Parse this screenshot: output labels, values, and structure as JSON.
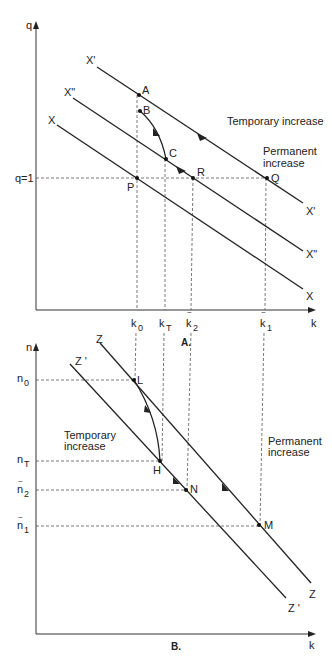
{
  "panel_a": {
    "caption": "A.",
    "y_axis_label": "q",
    "x_axis_label": "k",
    "q_level_label": "q=1",
    "curves": [
      {
        "name": "X'",
        "label_start": "X'",
        "label_end": "X'"
      },
      {
        "name": "X\"",
        "label_start": "X\"",
        "label_end": "X\""
      },
      {
        "name": "X",
        "label_start": "X",
        "label_end": "X"
      }
    ],
    "points": {
      "A": "A",
      "B": "B",
      "C": "C",
      "P": "P",
      "R": "R",
      "Q": "Q"
    },
    "x_ticks": [
      {
        "base": "k",
        "sub": "0",
        "tilde": false
      },
      {
        "base": "k",
        "sub": "T",
        "tilde": false
      },
      {
        "base": "k",
        "sub": "2",
        "tilde": true
      },
      {
        "base": "k",
        "sub": "1",
        "tilde": true
      }
    ],
    "annotations": {
      "temporary": "Temporary increase",
      "permanent_line1": "Permanent",
      "permanent_line2": "increase"
    }
  },
  "panel_b": {
    "caption": "B.",
    "y_axis_label": "n",
    "x_axis_label": "k",
    "curves": [
      {
        "name": "Z",
        "label_start": "Z",
        "label_end": "Z"
      },
      {
        "name": "Z'",
        "label_start": "Z '",
        "label_end": "Z '"
      }
    ],
    "points": {
      "L": "L",
      "H": "H",
      "N": "N",
      "M": "M"
    },
    "y_ticks": [
      {
        "base": "n",
        "sub": "0",
        "tilde": false
      },
      {
        "base": "n",
        "sub": "T",
        "tilde": false
      },
      {
        "base": "n",
        "sub": "2",
        "tilde": true
      },
      {
        "base": "n",
        "sub": "1",
        "tilde": true
      }
    ],
    "annotations": {
      "temporary_line1": "Temporary",
      "temporary_line2": "increase",
      "permanent_line1": "Permanent",
      "permanent_line2": "increase"
    }
  },
  "colors": {
    "ink": "#222222",
    "dash": "#555555",
    "background": "#ffffff"
  }
}
